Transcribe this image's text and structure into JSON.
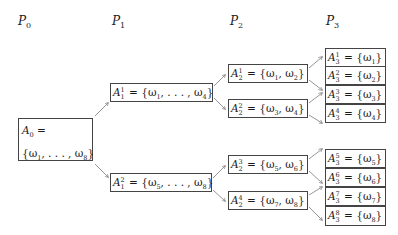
{
  "levels": [
    {
      "symbol": "P",
      "index": "0"
    },
    {
      "symbol": "P",
      "index": "1"
    },
    {
      "symbol": "P",
      "index": "2"
    },
    {
      "symbol": "P",
      "index": "3"
    }
  ],
  "nodes": {
    "root": {
      "name": "A",
      "sub": "0",
      "line1_suffix": " =",
      "line2": "{ω",
      "line2_a": "1",
      "line2_mid": ", . . . , ω",
      "line2_b": "8",
      "line2_end": "}"
    },
    "level1": [
      {
        "sup": "1",
        "sub": "1",
        "set": "= {ω",
        "a": "1",
        "mid": ", . . . , ω",
        "b": "4",
        "end": "}"
      },
      {
        "sup": "2",
        "sub": "1",
        "set": "= {ω",
        "a": "5",
        "mid": ", . . . , ω",
        "b": "8",
        "end": "}"
      }
    ],
    "level2": [
      {
        "sup": "1",
        "sub": "2",
        "set": "= {ω",
        "a": "1",
        "mid": ", ω",
        "b": "2",
        "end": "}"
      },
      {
        "sup": "2",
        "sub": "2",
        "set": "= {ω",
        "a": "3",
        "mid": ", ω",
        "b": "4",
        "end": "}"
      },
      {
        "sup": "3",
        "sub": "2",
        "set": "= {ω",
        "a": "5",
        "mid": ", ω",
        "b": "6",
        "end": "}"
      },
      {
        "sup": "4",
        "sub": "2",
        "set": "= {ω",
        "a": "7",
        "mid": ", ω",
        "b": "8",
        "end": "}"
      }
    ],
    "level3": [
      {
        "sup": "1",
        "sub": "3",
        "set": "= {ω",
        "a": "1",
        "end": "}"
      },
      {
        "sup": "2",
        "sub": "3",
        "set": "= {ω",
        "a": "2",
        "end": "}"
      },
      {
        "sup": "3",
        "sub": "3",
        "set": "= {ω",
        "a": "3",
        "end": "}"
      },
      {
        "sup": "4",
        "sub": "3",
        "set": "= {ω",
        "a": "4",
        "end": "}"
      },
      {
        "sup": "5",
        "sub": "3",
        "set": "= {ω",
        "a": "5",
        "end": "}"
      },
      {
        "sup": "6",
        "sub": "3",
        "set": "= {ω",
        "a": "6",
        "end": "}"
      },
      {
        "sup": "7",
        "sub": "3",
        "set": "= {ω",
        "a": "7",
        "end": "}"
      },
      {
        "sup": "8",
        "sub": "3",
        "set": "= {ω",
        "a": "8",
        "end": "}"
      }
    ]
  },
  "colors": {
    "border": "#444444",
    "arrow": "#7a7a7a",
    "text": "#1a1a1a"
  }
}
